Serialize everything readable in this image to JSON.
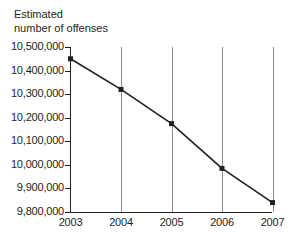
{
  "chart_data": {
    "type": "line",
    "title": "Estimated\nnumber of offenses",
    "xlabel": "",
    "ylabel": "Estimated number of offenses",
    "categories": [
      "2003",
      "2004",
      "2005",
      "2006",
      "2007"
    ],
    "values": [
      10450000,
      10320000,
      10175000,
      9985000,
      9840000
    ],
    "series": [
      {
        "name": "Estimated number of offenses",
        "values": [
          10450000,
          10320000,
          10175000,
          9985000,
          9840000
        ]
      }
    ],
    "x": [
      2003,
      2004,
      2005,
      2006,
      2007
    ],
    "ylim": [
      9800000,
      10500000
    ],
    "xlim": [
      2003,
      2007
    ],
    "ytick_values": [
      10500000,
      10400000,
      10300000,
      10200000,
      10100000,
      10000000,
      9900000,
      9800000
    ],
    "ytick_labels": [
      "10,500,000",
      "10,400,000",
      "10,300,000",
      "10,200,000",
      "10,100,000",
      "10,000,000",
      "9,900,000",
      "9,800,000"
    ],
    "xtick_labels": [
      "2003",
      "2004",
      "2005",
      "2006",
      "2007"
    ],
    "grid": "vertical",
    "legend": "none",
    "marker": "square",
    "line_color": "#231f20",
    "marker_color": "#231f20",
    "grid_color": "#8c8c8c",
    "axis_color": "#231f20",
    "text_color": "#231f20",
    "background_color": "#ffffff"
  }
}
